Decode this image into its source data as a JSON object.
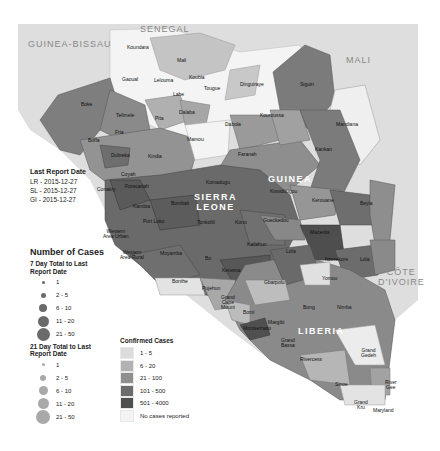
{
  "map": {
    "countries": {
      "guinea": "GUINEA",
      "sierra_leone": [
        "SIERRA",
        "LEONE"
      ],
      "liberia": "LIBERIA"
    },
    "neighbors": {
      "senegal": "SENEGAL",
      "guinea_bissau": "GUINEA-BISSAU",
      "mali": "MALI",
      "cote_divoire": [
        "CÔTE",
        "D'IVOIRE"
      ]
    },
    "capitals": {
      "conakry": "Conakry"
    },
    "districts": {
      "koundara": "Koundara",
      "mali": "Mali",
      "gaoual": "Gaoual",
      "lelouma": "Lelouma",
      "koubia": "Koubia",
      "labe": "Labe",
      "tougue": "Tougue",
      "dinguiraye": "Dinguiraye",
      "siguiri": "Siguiri",
      "mandiana": "Mandiana",
      "boke": "Boke",
      "telimele": "Telimele",
      "pita": "Pita",
      "dalaba": "Dalaba",
      "fria": "Fria",
      "boffa": "Boffa",
      "dubreka": "Dubreka",
      "kindia": "Kindia",
      "mamou": "Mamou",
      "dabola": "Dabola",
      "kouroussa": "Kouroussa",
      "faranah": "Faranah",
      "kankan": "Kankan",
      "coyah": "Coyah",
      "forecariah": "Forecariah",
      "kambia": "Kambia",
      "koinadugu": "Koinadugu",
      "bombali": "Bombali",
      "port_loko": "Port Loko",
      "tonkolili": "Tonkolili",
      "kono": "Kono",
      "kissidougou": "Kissidougou",
      "kerouane": "Kerouane",
      "beyla": "Beyla",
      "gueckedou": "Gueckedou",
      "macenta": "Macenta",
      "kailahun": "Kailahun",
      "lofa": "Lofa",
      "nzerekore": "Nzerekore",
      "lola": "Lola",
      "western_urban": [
        "Western",
        "Area Urban"
      ],
      "western_rural": [
        "Western",
        "Area Rural"
      ],
      "moyamba": "Moyamba",
      "bo": "Bo",
      "kenema": "Kenema",
      "bonthe": "Bonthe",
      "pujehun": "Pujehun",
      "gbarpolu": "Gbarpolu",
      "yomou": "Yomou",
      "grand_cape_mount": [
        "Grand",
        "Cape",
        "Mount"
      ],
      "bong": "Bong",
      "nimba": "Nimba",
      "bomi": "Bomi",
      "margibi": "Margibi",
      "montserrado": "Montserrado",
      "grand_bassa": [
        "Grand",
        "Bassa"
      ],
      "rivercess": "Rivercess",
      "grand_gedeh": [
        "Grand",
        "Gedeh"
      ],
      "sinoe": "Sinoe",
      "river_gee": [
        "River",
        "Gee"
      ],
      "grand_kru": [
        "Grand",
        "Kru"
      ],
      "maryland": "Maryland"
    }
  },
  "report_dates": {
    "title": "Last Report Date",
    "lines": [
      "LR - 2015-12-27",
      "SL - 2015-12-27",
      "GI - 2015-12-27"
    ]
  },
  "legend": {
    "title": "Number of Cases",
    "seven_day": {
      "title": "7 Day Total to Last Report Date",
      "items": [
        {
          "label": "1",
          "size": 3
        },
        {
          "label": "2 - 5",
          "size": 5
        },
        {
          "label": "6 - 10",
          "size": 8
        },
        {
          "label": "11 - 20",
          "size": 11
        },
        {
          "label": "21 - 50",
          "size": 13
        }
      ],
      "color": "#6a6a6a"
    },
    "twentyone_day": {
      "title": "21 Day Total to Last Report Date",
      "items": [
        {
          "label": "1",
          "size": 3
        },
        {
          "label": "2 - 5",
          "size": 6
        },
        {
          "label": "6 - 10",
          "size": 9
        },
        {
          "label": "11 - 20",
          "size": 11
        },
        {
          "label": "21 - 50",
          "size": 14
        }
      ],
      "color": "#a9a9a9"
    },
    "confirmed": {
      "title": "Confirmed Cases",
      "items": [
        {
          "label": "1 - 5",
          "color": "#dcdcdc"
        },
        {
          "label": "6 - 20",
          "color": "#b2b2b2"
        },
        {
          "label": "21 - 100",
          "color": "#8f8f8f"
        },
        {
          "label": "101 - 500",
          "color": "#6c6c6c"
        },
        {
          "label": "501 - 4000",
          "color": "#4f4f4f"
        },
        {
          "label": "No cases reported",
          "color": "#f4f4f4"
        }
      ]
    }
  }
}
